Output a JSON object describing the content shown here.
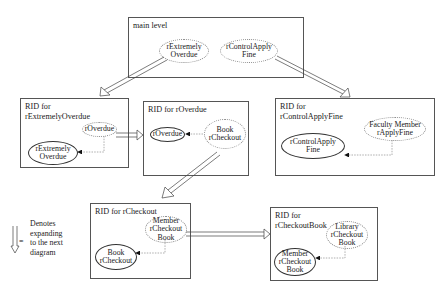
{
  "main": {
    "title": "main level",
    "nodes": [
      "rExtremely\nOverdue",
      "rControlApply\nFine"
    ]
  },
  "rid_extremely_overdue": {
    "title": "RID for\nrExtremelyOverdue",
    "nodes": [
      "rOverdue",
      "rExtremely\nOverdue"
    ]
  },
  "rid_overdue": {
    "title": "RID for rOverdue",
    "nodes": [
      "rOverdue",
      "Book\nrCheckout"
    ]
  },
  "rid_control_apply_fine": {
    "title": "RID for\nrControlApplyFine",
    "nodes": [
      "Faculty Member\nrApplyFine",
      "rControlApply\nFine"
    ]
  },
  "rid_checkout": {
    "title": "RID for rCheckout",
    "nodes": [
      "Member\nrCheckout\nBook",
      "Book\nrCheckout"
    ]
  },
  "rid_checkout_book": {
    "title": "RID for\nrCheckoutBook",
    "nodes": [
      "Library\nrCheckout\nBook",
      "Member\nrCheckout\nBook"
    ]
  },
  "legend": {
    "symbol": "=",
    "text": "Denotes\nexpanding\nto the next\ndiagram"
  }
}
